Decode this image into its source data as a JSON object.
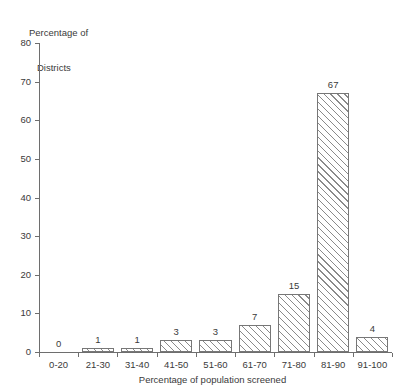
{
  "chart_data": {
    "type": "bar",
    "title": "",
    "xlabel": "Percentage of population screened",
    "ylabel": "Percentage of Districts",
    "ylabel_lines": [
      "Percentage of",
      "Districts"
    ],
    "categories": [
      "0-20",
      "21-30",
      "31-40",
      "41-50",
      "51-60",
      "61-70",
      "71-80",
      "81-90",
      "91-100"
    ],
    "values": [
      0,
      1,
      1,
      3,
      3,
      7,
      15,
      67,
      4
    ],
    "value_labels": [
      "0",
      "1",
      "1",
      "3",
      "3",
      "7",
      "15",
      "67",
      "4"
    ],
    "ylim": [
      0,
      80
    ],
    "yticks": [
      0,
      10,
      20,
      30,
      40,
      50,
      60,
      70,
      80
    ],
    "ytick_labels": [
      "0",
      "10",
      "20",
      "30",
      "40",
      "50",
      "60",
      "70",
      "80"
    ],
    "grid": false,
    "legend": false,
    "bar_fill": "hatch-diagonal-45",
    "bar_edge_color": "#777777",
    "hatch_color": "#8a8a8a",
    "background": "#ffffff",
    "text_color": "#3a3a3a",
    "axis_color": "#6e6e6e"
  }
}
